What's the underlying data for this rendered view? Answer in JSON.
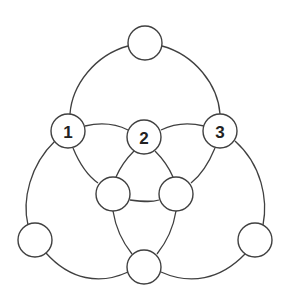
{
  "diagram": {
    "type": "magic-circles-puzzle",
    "nodes": [
      {
        "id": "top",
        "label": ""
      },
      {
        "id": "n1",
        "label": "1"
      },
      {
        "id": "n2",
        "label": "2"
      },
      {
        "id": "n3",
        "label": "3"
      },
      {
        "id": "inner-left",
        "label": ""
      },
      {
        "id": "inner-right",
        "label": ""
      },
      {
        "id": "bottom-left",
        "label": ""
      },
      {
        "id": "bottom-right",
        "label": ""
      },
      {
        "id": "bottom",
        "label": ""
      }
    ],
    "colors": {
      "stroke": "#404040",
      "fill": "#ffffff",
      "text": "#222222"
    }
  }
}
